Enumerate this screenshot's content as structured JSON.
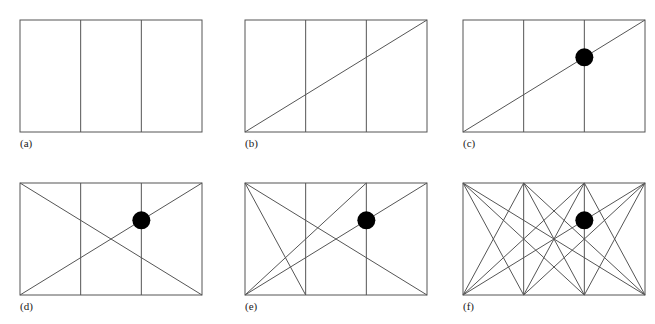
{
  "figure": {
    "type": "diagram",
    "title": "",
    "background_color": "#ffffff",
    "line_color": "#555555",
    "dot_color": "#000000",
    "caption_color": "#1a1a1a",
    "stroke_width": 1,
    "dot_radius": 9,
    "panel_geometry": {
      "rect_width": 182,
      "rect_height": 112,
      "divider_fractions": [
        0.3333,
        0.6667
      ],
      "node_labels": [
        "TL",
        "T1",
        "T2",
        "TR",
        "BL",
        "B1",
        "B2",
        "BR"
      ]
    },
    "panels": [
      {
        "id": "a",
        "caption": "(a)",
        "origin_x": 20,
        "origin_y": 20,
        "dot": null,
        "chords": []
      },
      {
        "id": "b",
        "caption": "(b)",
        "origin_x": 245,
        "origin_y": 20,
        "dot": null,
        "chords": [
          [
            "BL",
            "TR"
          ]
        ]
      },
      {
        "id": "c",
        "caption": "(c)",
        "origin_x": 463,
        "origin_y": 20,
        "dot": {
          "u": 0.6667,
          "v": 0.6667
        },
        "chords": [
          [
            "BL",
            "TR"
          ]
        ]
      },
      {
        "id": "d",
        "caption": "(d)",
        "origin_x": 20,
        "origin_y": 183,
        "dot": {
          "u": 0.6667,
          "v": 0.6667
        },
        "chords": [
          [
            "BL",
            "TR"
          ],
          [
            "TL",
            "BR"
          ]
        ]
      },
      {
        "id": "e",
        "caption": "(e)",
        "origin_x": 245,
        "origin_y": 183,
        "dot": {
          "u": 0.6667,
          "v": 0.6667
        },
        "chords": [
          [
            "BL",
            "TR"
          ],
          [
            "TL",
            "BR"
          ],
          [
            "TL",
            "B1"
          ],
          [
            "BL",
            "T2"
          ]
        ]
      },
      {
        "id": "f",
        "caption": "(f)",
        "origin_x": 463,
        "origin_y": 183,
        "dot": {
          "u": 0.6667,
          "v": 0.6667
        },
        "chords": [
          [
            "TL",
            "BR"
          ],
          [
            "BL",
            "TR"
          ],
          [
            "TL",
            "B1"
          ],
          [
            "TL",
            "B2"
          ],
          [
            "T1",
            "BL"
          ],
          [
            "T1",
            "B2"
          ],
          [
            "T1",
            "BR"
          ],
          [
            "T2",
            "BL"
          ],
          [
            "T2",
            "B1"
          ],
          [
            "T2",
            "BR"
          ],
          [
            "TR",
            "B1"
          ],
          [
            "TR",
            "B2"
          ]
        ]
      }
    ]
  }
}
